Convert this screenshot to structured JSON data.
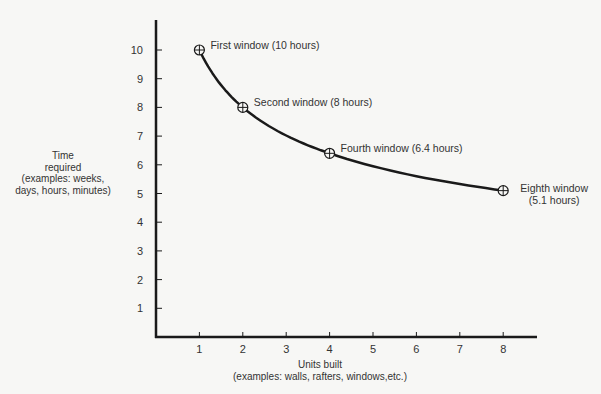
{
  "chart_data": {
    "type": "line",
    "title": "",
    "xlabel": "Units built",
    "xlabel_sub": "(examples: walls, rafters, windows,etc.)",
    "ylabel_lines": [
      "Time",
      "required",
      "(examples: weeks,",
      "days, hours, minutes)"
    ],
    "x_ticks": [
      1,
      2,
      3,
      4,
      5,
      6,
      7,
      8
    ],
    "y_ticks": [
      1,
      2,
      3,
      4,
      5,
      6,
      7,
      8,
      9,
      10
    ],
    "xlim": [
      0,
      8.8
    ],
    "ylim": [
      0,
      11
    ],
    "grid": false,
    "series": [
      {
        "name": "Learning curve",
        "x": [
          1,
          2,
          4,
          8
        ],
        "y": [
          10,
          8,
          6.4,
          5.1
        ]
      }
    ],
    "annotations": [
      {
        "x": 1,
        "y": 10,
        "lines": [
          "First window (10 hours)"
        ]
      },
      {
        "x": 2,
        "y": 8,
        "lines": [
          "Second window (8 hours)"
        ]
      },
      {
        "x": 4,
        "y": 6.4,
        "lines": [
          "Fourth window (6.4 hours)"
        ]
      },
      {
        "x": 8,
        "y": 5.1,
        "lines": [
          "Eighth window",
          "(5.1 hours)"
        ]
      }
    ]
  },
  "colors": {
    "ink": "#1a1a1a",
    "text": "#333333",
    "background": "#f7f7f5"
  }
}
